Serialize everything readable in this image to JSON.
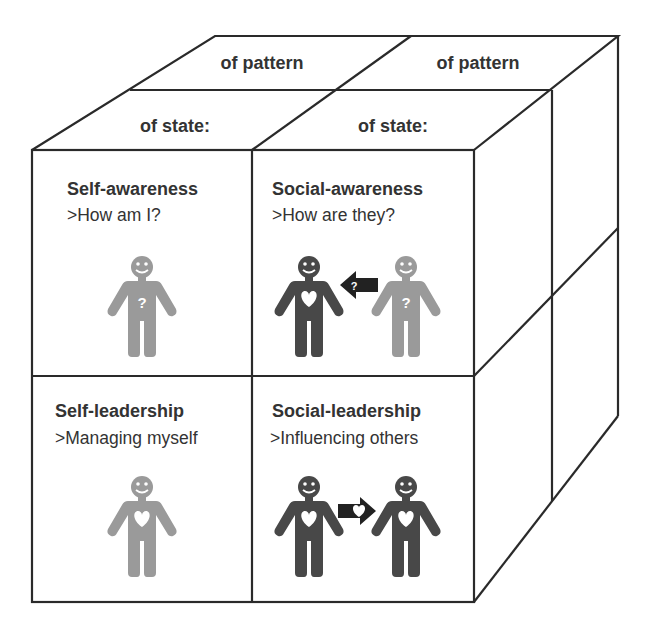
{
  "top_face": {
    "back_row": [
      "of pattern",
      "of pattern"
    ],
    "front_row": [
      "of state:",
      "of state:"
    ]
  },
  "cells": [
    {
      "title": "Self-awareness",
      "subtitle": ">How am I?",
      "figures": [
        "light-question"
      ]
    },
    {
      "title": "Social-awareness",
      "subtitle": ">How are they?",
      "figures": [
        "dark-heart",
        "arrow-left-question",
        "light-question"
      ]
    },
    {
      "title": "Self-leadership",
      "subtitle": ">Managing myself",
      "figures": [
        "light-heart"
      ]
    },
    {
      "title": "Social-leadership",
      "subtitle": ">Influencing others",
      "figures": [
        "dark-heart",
        "arrow-right-heart",
        "dark-heart"
      ]
    }
  ],
  "colors": {
    "line": "#2a2a2a",
    "figure_dark": "#484848",
    "figure_light": "#9a9a9a",
    "arrow": "#222222",
    "text": "#333333"
  }
}
